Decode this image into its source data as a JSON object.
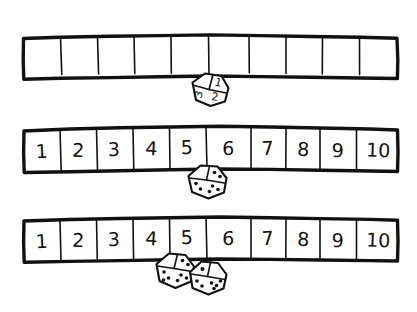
{
  "page": {
    "background_color": "#ffffff",
    "ink_color": "#111111",
    "width": 417,
    "height": 312
  },
  "rows": [
    {
      "id": "row-blank-numberline",
      "name": "blank-number-line",
      "cell_count": 10,
      "labels": [
        "",
        "",
        "",
        "",
        "",
        "",
        "",
        "",
        "",
        ""
      ],
      "has_labels": false,
      "dice": [
        {
          "id": "die-numeral-1-2-3",
          "style": "numeral",
          "faces": {
            "top_right": "1",
            "left": "3",
            "bottom": "2"
          },
          "value": 1
        }
      ]
    },
    {
      "id": "row-numbered-one-die",
      "name": "numbered-number-line-one-die",
      "cell_count": 10,
      "labels": [
        "1",
        "2",
        "3",
        "4",
        "5",
        "6",
        "7",
        "8",
        "9",
        "10"
      ],
      "has_labels": true,
      "dice": [
        {
          "id": "die-pips-single",
          "style": "pips",
          "faces": {
            "left": 2,
            "top_right": 2,
            "bottom_right": 3
          },
          "value": 2
        }
      ]
    },
    {
      "id": "row-numbered-two-dice",
      "name": "numbered-number-line-two-dice",
      "cell_count": 10,
      "labels": [
        "1",
        "2",
        "3",
        "4",
        "5",
        "6",
        "7",
        "8",
        "9",
        "10"
      ],
      "has_labels": true,
      "dice": [
        {
          "id": "die-pips-left",
          "style": "pips",
          "faces": {
            "left": 2,
            "top_right": 2,
            "bottom_right": 3
          },
          "value": 2
        },
        {
          "id": "die-pips-right",
          "style": "pips",
          "faces": {
            "top_left": 1,
            "bottom_left": 2,
            "bottom_right": 3
          },
          "value": 1
        }
      ]
    }
  ]
}
